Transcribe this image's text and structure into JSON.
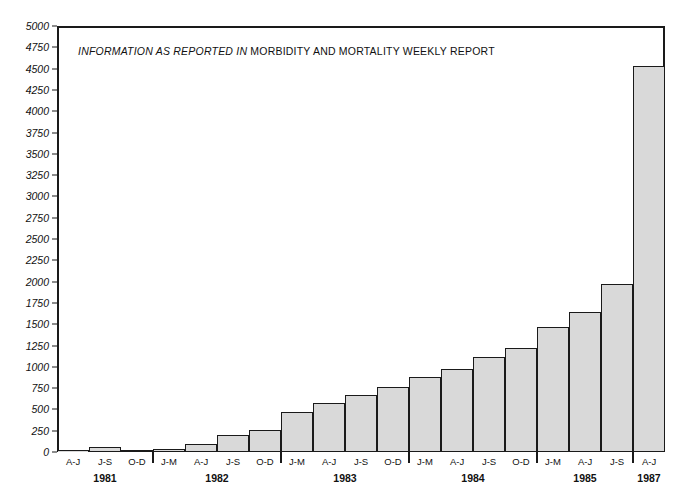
{
  "chart_data": {
    "type": "bar",
    "title": "INFORMATION AS REPORTED IN MORBIDITY AND MORTALITY WEEKLY REPORT",
    "title_italic_part": "INFORMATION AS REPORTED IN",
    "title_roman_part": " MORBIDITY AND MORTALITY WEEKLY REPORT",
    "xlabel": "",
    "ylabel": "",
    "ylim": [
      0,
      5000
    ],
    "ytick_step": 250,
    "grid": false,
    "legend": null,
    "bar_fill_color": "#d9d9d9",
    "bar_edge_color": "#1a1a1a",
    "categories": [
      "A-J",
      "J-S",
      "O-D",
      "J-M",
      "A-J",
      "J-S",
      "O-D",
      "J-M",
      "A-J",
      "J-S",
      "O-D",
      "J-M",
      "A-J",
      "J-S",
      "O-D",
      "J-M",
      "A-J",
      "J-S",
      "A-J"
    ],
    "values": [
      5,
      55,
      20,
      35,
      90,
      205,
      260,
      465,
      575,
      665,
      760,
      880,
      970,
      1120,
      1215,
      1470,
      1640,
      1970,
      4530
    ],
    "ytick_labels": [
      "0",
      "250",
      "500",
      "750",
      "1000",
      "1250",
      "1500",
      "1750",
      "2000",
      "2250",
      "2500",
      "2750",
      "3000",
      "3250",
      "3500",
      "3750",
      "4000",
      "4250",
      "4500",
      "4750",
      "5000"
    ],
    "ytick_values": [
      0,
      250,
      500,
      750,
      1000,
      1250,
      1500,
      1750,
      2000,
      2250,
      2500,
      2750,
      3000,
      3250,
      3500,
      3750,
      4000,
      4250,
      4500,
      4750,
      5000
    ],
    "year_groups": [
      {
        "label": "1981",
        "count": 3
      },
      {
        "label": "1982",
        "count": 4
      },
      {
        "label": "1983",
        "count": 4
      },
      {
        "label": "1984",
        "count": 4
      },
      {
        "label": "1985",
        "count": 3
      },
      {
        "label": "1987",
        "count": 1
      }
    ]
  }
}
